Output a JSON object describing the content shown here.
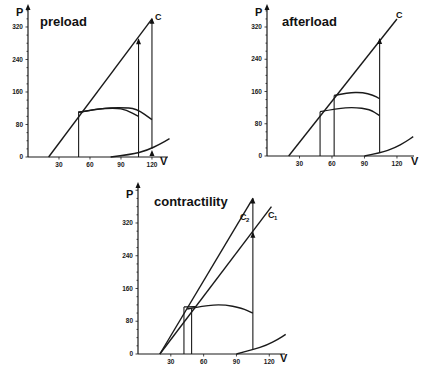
{
  "chart_data": [
    {
      "type": "line",
      "title": "preload",
      "xlabel": "V",
      "ylabel": "P",
      "xticks": [
        30,
        60,
        90,
        120
      ],
      "yticks": [
        0,
        80,
        160,
        240,
        320
      ],
      "xlim": [
        0,
        140
      ],
      "ylim": [
        0,
        360
      ],
      "frame": {
        "x0": 28,
        "y0": 157,
        "px_per_x": 1.033,
        "px_per_y": 0.4063,
        "top": 4,
        "right": 168
      },
      "series": [
        {
          "name": "C (end-systolic line)",
          "label": "C",
          "points": [
            [
              20,
              0
            ],
            [
              120,
              340
            ]
          ]
        },
        {
          "name": "isovolumic line V=49",
          "points": [
            [
              49,
              0
            ],
            [
              49,
              112
            ]
          ]
        },
        {
          "name": "isovolumic line V=107",
          "points": [
            [
              107,
              0
            ],
            [
              107,
              290
            ]
          ]
        },
        {
          "name": "isovolumic line V=120",
          "points": [
            [
              120,
              20
            ],
            [
              120,
              340
            ]
          ]
        },
        {
          "name": "ejection curve 1",
          "points": [
            [
              49,
              110
            ],
            [
              65,
              118
            ],
            [
              85,
              121
            ],
            [
              95,
              116
            ],
            [
              107,
              100
            ]
          ]
        },
        {
          "name": "ejection curve 2",
          "points": [
            [
              49,
              110
            ],
            [
              70,
              120
            ],
            [
              90,
              122
            ],
            [
              105,
              119
            ],
            [
              120,
              92
            ]
          ]
        },
        {
          "name": "end-diastolic curve",
          "points": [
            [
              80,
              0
            ],
            [
              100,
              6
            ],
            [
              115,
              16
            ],
            [
              128,
              32
            ],
            [
              137,
              45
            ]
          ]
        }
      ],
      "arrows": [
        [
          107,
          290
        ],
        [
          120,
          340
        ],
        [
          120,
          15
        ]
      ]
    },
    {
      "type": "line",
      "title": "afterload",
      "xlabel": "V",
      "ylabel": "P",
      "xticks": [
        30,
        60,
        90,
        120
      ],
      "yticks": [
        0,
        80,
        160,
        240,
        320
      ],
      "xlim": [
        0,
        140
      ],
      "ylim": [
        0,
        360
      ],
      "frame": {
        "x0": 267,
        "y0": 156,
        "px_per_x": 1.083,
        "px_per_y": 0.4031,
        "top": 4,
        "right": 414
      },
      "series": [
        {
          "name": "C (end-systolic line)",
          "label": "C",
          "points": [
            [
              20,
              0
            ],
            [
              120,
              340
            ]
          ]
        },
        {
          "name": "isovolumic line V=49",
          "points": [
            [
              49,
              0
            ],
            [
              49,
              110
            ]
          ]
        },
        {
          "name": "isovolumic line V=62",
          "points": [
            [
              62,
              0
            ],
            [
              62,
              150
            ]
          ]
        },
        {
          "name": "isovolumic line V=104",
          "points": [
            [
              104,
              10
            ],
            [
              104,
              290
            ]
          ]
        },
        {
          "name": "ejection curve low afterload",
          "points": [
            [
              49,
              110
            ],
            [
              65,
              118
            ],
            [
              80,
              121
            ],
            [
              95,
              116
            ],
            [
              104,
              100
            ]
          ]
        },
        {
          "name": "ejection curve high afterload",
          "points": [
            [
              62,
              150
            ],
            [
              75,
              157
            ],
            [
              88,
              158
            ],
            [
              98,
              151
            ],
            [
              104,
              142
            ]
          ]
        },
        {
          "name": "end-diastolic curve",
          "points": [
            [
              90,
              0
            ],
            [
              105,
              8
            ],
            [
              118,
              20
            ],
            [
              128,
              35
            ],
            [
              135,
              48
            ]
          ]
        }
      ],
      "arrows": [
        [
          104,
          290
        ]
      ]
    },
    {
      "type": "line",
      "title": "contractility",
      "xlabel": "V",
      "ylabel": "P",
      "xticks": [
        30,
        60,
        90,
        120
      ],
      "yticks": [
        0,
        80,
        160,
        240,
        320
      ],
      "xlim": [
        0,
        140
      ],
      "ylim": [
        0,
        400
      ],
      "frame": {
        "x0": 138,
        "y0": 354,
        "px_per_x": 1.094,
        "px_per_y": 0.4094,
        "top": 182,
        "right": 285
      },
      "series": [
        {
          "name": "C2 (higher contractility)",
          "label": "C2",
          "points": [
            [
              20,
              0
            ],
            [
              105,
              380
            ]
          ]
        },
        {
          "name": "C1 (baseline contractility)",
          "label": "C1",
          "points": [
            [
              20,
              0
            ],
            [
              122,
              360
            ]
          ]
        },
        {
          "name": "isovolumic line V=42",
          "points": [
            [
              42,
              0
            ],
            [
              42,
              115
            ]
          ]
        },
        {
          "name": "isovolumic line V=49",
          "points": [
            [
              49,
              0
            ],
            [
              49,
              112
            ]
          ]
        },
        {
          "name": "isovolumic line V=105",
          "points": [
            [
              105,
              12
            ],
            [
              105,
              380
            ]
          ]
        },
        {
          "name": "ejection curve C2",
          "points": [
            [
              42,
              115
            ],
            [
              55,
              116
            ],
            [
              49,
              115
            ]
          ]
        },
        {
          "name": "ejection curve",
          "points": [
            [
              45,
              110
            ],
            [
              60,
              118
            ],
            [
              78,
              121
            ],
            [
              95,
              112
            ],
            [
              105,
              100
            ]
          ]
        },
        {
          "name": "end-diastolic curve",
          "points": [
            [
              90,
              0
            ],
            [
              105,
              10
            ],
            [
              118,
              22
            ],
            [
              128,
              36
            ],
            [
              135,
              48
            ]
          ]
        }
      ],
      "arrows": [
        [
          105,
          380
        ],
        [
          105,
          296
        ]
      ]
    }
  ],
  "panels": {
    "preload": {
      "title": "preload",
      "ylabel": "P",
      "xlabel": "V",
      "clabel": "C"
    },
    "afterload": {
      "title": "afterload",
      "ylabel": "P",
      "xlabel": "V",
      "clabel": "C"
    },
    "contractility": {
      "title": "contractility",
      "ylabel": "P",
      "xlabel": "V",
      "c2label": "C",
      "c2sub": "2",
      "c1label": "C",
      "c1sub": "1"
    }
  },
  "ticks": {
    "x": [
      "30",
      "60",
      "90",
      "120"
    ],
    "y": [
      "0",
      "80",
      "160",
      "240",
      "320"
    ]
  }
}
